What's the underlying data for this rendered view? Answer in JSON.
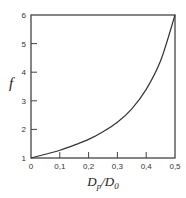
{
  "chart_data": {
    "type": "line",
    "title": "",
    "xlabel": "D_p/D_0",
    "xlabel_parts": {
      "main1": "D",
      "sub1": "p",
      "sep": "/",
      "main2": "D",
      "sub2": "0"
    },
    "ylabel": "f",
    "xlim": [
      0,
      0.5
    ],
    "ylim": [
      1,
      6
    ],
    "x_ticks": [
      0,
      0.1,
      0.2,
      0.3,
      0.4,
      0.5
    ],
    "x_tick_labels": [
      "0",
      "0,1",
      "0,2",
      "0,3",
      "0,4",
      "0,5"
    ],
    "y_ticks": [
      1,
      2,
      3,
      4,
      5,
      6
    ],
    "y_tick_labels": [
      "1",
      "2",
      "3",
      "4",
      "5",
      "6"
    ],
    "grid": false,
    "legend": null,
    "series": [
      {
        "name": "f",
        "color": "#333333",
        "x": [
          0,
          0.05,
          0.1,
          0.15,
          0.2,
          0.25,
          0.3,
          0.35,
          0.4,
          0.45,
          0.5
        ],
        "values": [
          1.0,
          1.13,
          1.27,
          1.45,
          1.65,
          1.92,
          2.25,
          2.72,
          3.4,
          4.4,
          6.0
        ]
      }
    ]
  }
}
